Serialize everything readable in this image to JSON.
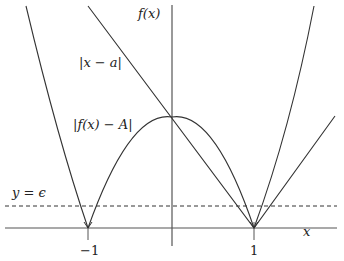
{
  "diagram": {
    "labels": {
      "y_axis": "f(x)",
      "x_axis": "x",
      "abs_x_minus_a": "|x − a|",
      "abs_f_minus_A": "|f(x) − A|",
      "epsilon_line": "y = ϵ"
    },
    "ticks": {
      "neg_one": "−1",
      "pos_one": "1"
    },
    "colors": {
      "curve": "#333333",
      "axis": "#555555",
      "background": "#ffffff"
    },
    "elements": [
      "y-axis f(x)",
      "x-axis x",
      "curve |x − a| (V-shape through (1,0))",
      "curve |f(x) − A| (arch with zeros at −1 and 1)",
      "dashed horizontal line y = ϵ",
      "outer parabola-like curve through (−1,0) and (1,0)"
    ]
  }
}
